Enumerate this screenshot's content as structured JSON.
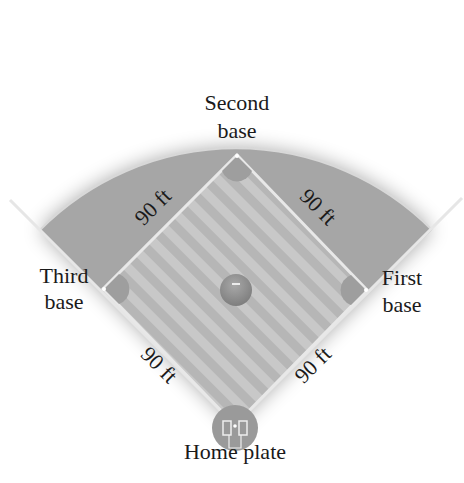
{
  "labels": {
    "second_base_line1": "Second",
    "second_base_line2": "base",
    "third_base_line1": "Third",
    "third_base_line2": "base",
    "first_base_line1": "First",
    "first_base_line2": "base",
    "home_plate": "Home plate"
  },
  "distances": {
    "home_to_third": "90 ft",
    "third_to_second": "90 ft",
    "second_to_first": "90 ft",
    "first_to_home": "90 ft"
  },
  "colors": {
    "outfield": "#a6a6a6",
    "infield_light": "#c8c8c8",
    "infield_dark": "#b4b4b4",
    "base_line": "#e8e8e8",
    "mound": "#8c8c8c",
    "text": "#1a1a1a"
  }
}
